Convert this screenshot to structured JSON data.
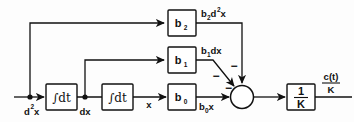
{
  "diagram": {
    "type": "control-system-block-diagram",
    "colors": {
      "line": "#111111",
      "box_fill": "#ffffff",
      "background": "#ffffff"
    },
    "input": {
      "label": "d",
      "sup": "2",
      "var": "x",
      "full": "d2x"
    },
    "nodes": [
      {
        "id": "input-node",
        "label_main": "d",
        "label_sup": "2",
        "label_var": "x",
        "x": 30,
        "y": 97
      },
      {
        "id": "dx-node",
        "label_main": "dx",
        "x": 85,
        "y": 97
      }
    ],
    "integrators": [
      {
        "id": "integrator-1",
        "label": "∫dt",
        "out_label": "dx"
      },
      {
        "id": "integrator-2",
        "label": "∫dt",
        "out_label": "x"
      }
    ],
    "gain_blocks": [
      {
        "id": "gain-b2",
        "label_main": "b",
        "label_sub": "2",
        "out_main": "b",
        "out_sub": "2",
        "out_rest": "d",
        "out_sup": "2",
        "out_var": "x"
      },
      {
        "id": "gain-b1",
        "label_main": "b",
        "label_sub": "1",
        "out_main": "b",
        "out_sub": "1",
        "out_rest": "dx"
      },
      {
        "id": "gain-b0",
        "label_main": "b",
        "label_sub": "0",
        "out_main": "b",
        "out_sub": "0",
        "out_rest": "x"
      }
    ],
    "summing_junction": {
      "id": "summing-junction",
      "sign_top": "−",
      "sign_diagonal": "−",
      "sign_left": "−",
      "signs": [
        "−",
        "−",
        "−"
      ]
    },
    "output_block": {
      "id": "output-gain",
      "numerator": "1",
      "denominator": "K"
    },
    "output_signal": {
      "numerator": "c(t)",
      "denominator": "K"
    },
    "wire_labels": {
      "dx": "dx",
      "x": "x"
    }
  }
}
